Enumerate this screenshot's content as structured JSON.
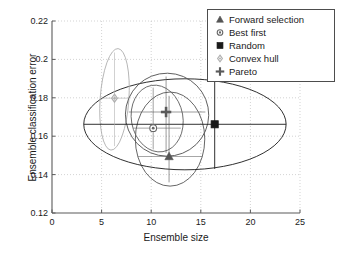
{
  "chart_data": {
    "type": "scatter",
    "title": "",
    "xlabel": "Ensemble size",
    "ylabel": "Ensemble classification error",
    "xlim": [
      0,
      25
    ],
    "ylim": [
      0.12,
      0.22
    ],
    "xticks": [
      "0",
      "5",
      "10",
      "15",
      "20",
      "25"
    ],
    "xtick_values": [
      0,
      5,
      10,
      15,
      20,
      25
    ],
    "yticks": [
      "0.12",
      "0.14",
      "0.16",
      "0.18",
      "0.2",
      "0.22"
    ],
    "ytick_values": [
      0.12,
      0.14,
      0.16,
      0.18,
      0.2,
      0.22
    ],
    "grid": true,
    "grid_style": "dotted",
    "legend_position": "top-right",
    "series": [
      {
        "name": "Forward selection",
        "marker": "triangle",
        "color": "#555555",
        "point": {
          "x": 11.8,
          "y": 0.1495
        },
        "ellipse": {
          "cx": 11.9,
          "cy": 0.1585,
          "rx": 3.5,
          "ry": 0.0245,
          "angle": 0
        }
      },
      {
        "name": "Best first",
        "marker": "circle",
        "color": "#666666",
        "point": {
          "x": 10.2,
          "y": 0.1642
        },
        "ellipse": {
          "cx": 10.6,
          "cy": 0.1692,
          "rx": 2.6,
          "ry": 0.0175,
          "angle": -10
        }
      },
      {
        "name": "Random",
        "marker": "square",
        "color": "#1a1a1a",
        "point": {
          "x": 16.4,
          "y": 0.1662
        },
        "ellipse": {
          "cx": 13.4,
          "cy": 0.1662,
          "rx": 10.2,
          "ry": 0.0237,
          "angle": 0
        }
      },
      {
        "name": "Convex hull",
        "marker": "diamond",
        "color": "#b0b0b0",
        "point": {
          "x": 6.3,
          "y": 0.1798
        },
        "ellipse": {
          "cx": 6.3,
          "cy": 0.1792,
          "rx": 1.45,
          "ry": 0.0265,
          "angle": 4
        }
      },
      {
        "name": "Pareto",
        "marker": "plus",
        "color": "#5a5a5a",
        "point": {
          "x": 11.5,
          "y": 0.1726
        },
        "ellipse": {
          "cx": 11.6,
          "cy": 0.1712,
          "rx": 4.2,
          "ry": 0.0216,
          "angle": 12
        }
      }
    ]
  },
  "legend": {
    "items": [
      {
        "label": "Forward selection",
        "marker": "triangle"
      },
      {
        "label": "Best first",
        "marker": "circle"
      },
      {
        "label": "Random",
        "marker": "square"
      },
      {
        "label": "Convex hull",
        "marker": "diamond"
      },
      {
        "label": "Pareto",
        "marker": "plus"
      }
    ]
  },
  "colors": {
    "axis": "#5a5a5a",
    "grid": "#c8c8c8",
    "text": "#1a1a1a",
    "random": "#1a1a1a",
    "forward_selection": "#555555",
    "best_first": "#666666",
    "convex_hull": "#b0b0b0",
    "pareto": "#5a5a5a"
  }
}
